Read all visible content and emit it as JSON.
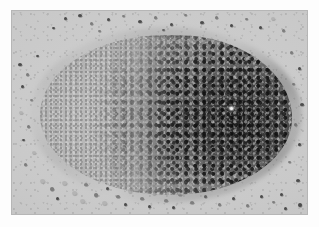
{
  "image": {
    "title": "Granular powder sample",
    "subject": "heap of granular powder on a grey photographic backdrop",
    "alt_text": "A conical heap of granular powder photographed from above; the left half of the heap is pale grey and finely grained while the right half is dark grey to near black and coarsely grained, with loose individual grains scattered across the light grey background around the heap.",
    "capture_type": "photograph",
    "color_mode": "grayscale"
  },
  "frame": {
    "outer_background": "#fdfdfd",
    "border_color": "#b6b6b6",
    "photo_left": 12,
    "photo_top": 11,
    "photo_width": 295,
    "photo_height": 203
  },
  "palette": {
    "backdrop_light": "#cfcfcf",
    "backdrop_mid": "#c9c9c9",
    "backdrop_shadow": "#bcbcbc",
    "powder_light": "#c4c4c4",
    "powder_mid": "#8e8e8e",
    "powder_dark": "#2d2d2d",
    "powder_darkest": "#161616",
    "highlight": "#f3f3f3",
    "grain_dark": "#4c4c4c",
    "grain_mid": "#7d7d7d",
    "grain_pale": "#b4b4b4"
  },
  "mound": {
    "label": "powder-heap",
    "left": 28,
    "top": 24,
    "width": 252,
    "height": 160,
    "light_region": "left half, fine grained, pale grey",
    "dark_region": "right half, coarse grained, near black",
    "highlight_spot": {
      "x": 190,
      "y": 72
    }
  },
  "scatter": {
    "label": "loose-grains",
    "description": "individual grains strewn around the heap, denser below and above the mound"
  }
}
